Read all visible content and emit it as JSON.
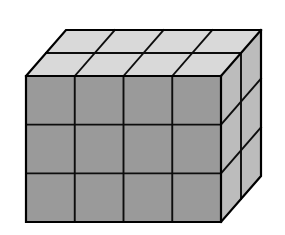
{
  "figure": {
    "title": "Rectangular block of unit cubes",
    "type": "oblique-projection-solid"
  },
  "geometry": {
    "width_cubes": 4,
    "height_cubes": 3,
    "depth_cubes": 2,
    "total_cubes": 24,
    "front_face_rows": 3,
    "front_face_columns": 4,
    "top_face_rows": 2,
    "top_face_columns": 4,
    "right_face_rows": 3,
    "right_face_columns": 2,
    "front_left_x": 26,
    "front_right_x": 221,
    "front_top_y": 76,
    "front_bottom_y": 222,
    "depth_offset_x": 40,
    "depth_offset_y": -46
  },
  "colors": {
    "background": "#ffffff",
    "front_face": "#9a9a9a",
    "top_face": "#d9d9d9",
    "right_face": "#bcbcbc",
    "outline": "#000000",
    "grid_line": "#0d0d0d"
  },
  "labels": {
    "front_face": "front-face",
    "top_face": "top-face",
    "right_face": "right-face"
  }
}
